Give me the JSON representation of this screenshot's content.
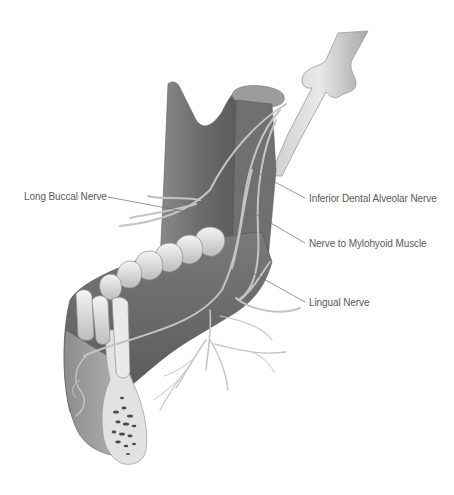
{
  "diagram": {
    "labels": [
      {
        "id": "long-buccal",
        "text": "Long Buccal Nerve",
        "x": 24,
        "y": 191
      },
      {
        "id": "inferior-dental-alveolar",
        "text": "Inferior Dental Alveolar Nerve",
        "x": 309,
        "y": 193
      },
      {
        "id": "nerve-mylohyoid",
        "text": "Nerve to Mylohyoid Muscle",
        "x": 309,
        "y": 238
      },
      {
        "id": "lingual",
        "text": "Lingual Nerve",
        "x": 309,
        "y": 297
      }
    ],
    "colors": {
      "background": "#ffffff",
      "bone_dark": "#6e6e6e",
      "bone_mid": "#9a9a9a",
      "bone_light": "#c8c8c8",
      "tooth": "#e4e4e4",
      "nerve": "#c2c2c2",
      "leader_line": "#6a6a6a",
      "label_text": "#5a5a5a"
    }
  }
}
